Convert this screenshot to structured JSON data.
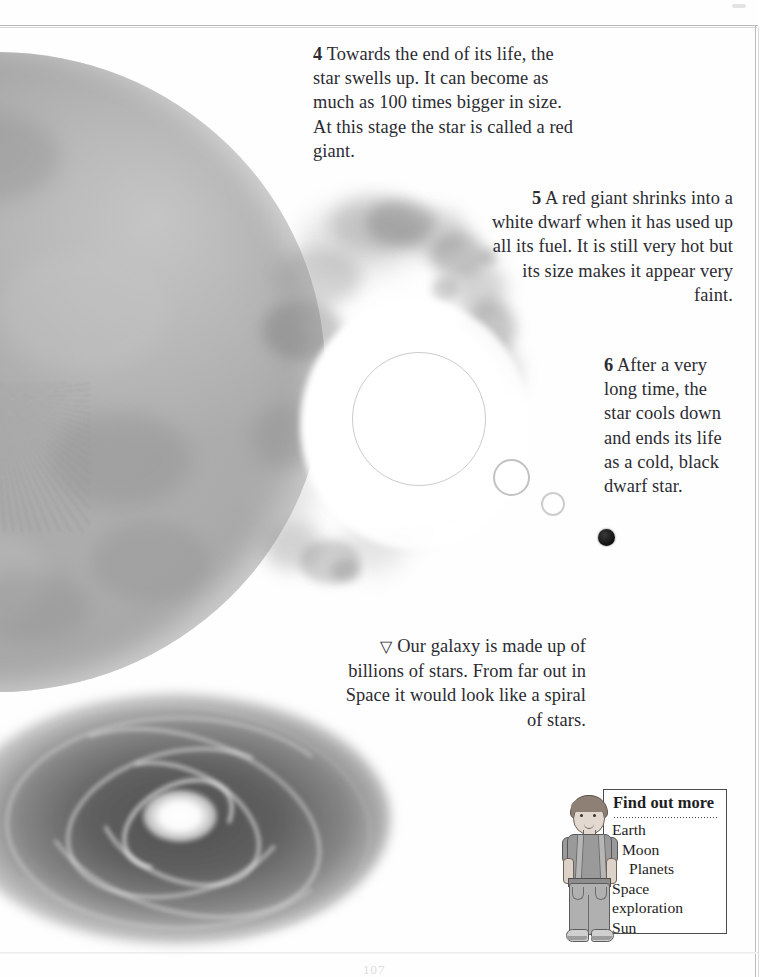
{
  "page": {
    "page_number": "107",
    "background_color": "#ffffff",
    "border_color": "#bcbcbc"
  },
  "steps": [
    {
      "number": "4",
      "text": "Towards the end of its life, the star swells up. It can become as much as 100 times bigger in size. At this stage the star is called a red giant.",
      "align": "left"
    },
    {
      "number": "5",
      "text": "A red giant shrinks into a white dwarf when it has used up all its fuel. It is still very hot but its size makes it appear very faint.",
      "align": "right"
    },
    {
      "number": "6",
      "text": "After a very long time, the star cools down and ends its life as a cold, black dwarf star.",
      "align": "left"
    }
  ],
  "galaxy_caption": {
    "marker": "▽",
    "text": "Our galaxy is made up of billions of stars. From far out in Space it would look like a spiral of stars."
  },
  "illustrations": {
    "red_giant_star": "large mottled grey star occupying left side of page",
    "nebula_shell": "ring of grey cloud wisps around bright core",
    "white_dwarf": "white ringed circle",
    "white_dwarf_small": "smaller white ringed circle",
    "black_dwarf": "solid black dot",
    "spiral_galaxy": "grey elliptical spiral galaxy with bright white core",
    "boy_figure": "cartoon boy in t-shirt, suspenders and jeans"
  },
  "find_out_more": {
    "title": "Find out more",
    "items": [
      {
        "label": "Earth",
        "indent": 1
      },
      {
        "label": "Moon",
        "indent": 2
      },
      {
        "label": "Planets",
        "indent": 3
      },
      {
        "label": "Space\nexploration",
        "indent": 1
      },
      {
        "label": "Sun",
        "indent": 1
      }
    ]
  },
  "colors": {
    "text": "#2b2b31",
    "star_grey": "#ababab",
    "galaxy_grey": "#6b6b6b",
    "box_border": "#4b4b4b"
  }
}
